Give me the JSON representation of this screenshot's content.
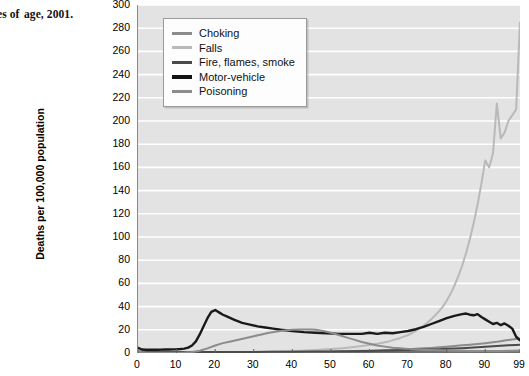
{
  "caption": {
    "line1": "g causes of",
    "line2": "age, 2001.",
    "source_label": "Source:",
    "line3": "L"
  },
  "chart_data": {
    "type": "line",
    "title": "",
    "xlabel": "",
    "ylabel": "Deaths per 100,000 population",
    "xlim": [
      0,
      99
    ],
    "ylim": [
      0,
      300
    ],
    "grid": true,
    "legend_position": "top-left-inside",
    "ytick_labels": [
      "300",
      "280",
      "260",
      "240",
      "220",
      "200",
      "180",
      "160",
      "140",
      "120",
      "100",
      "80",
      "60",
      "40",
      "20",
      "0"
    ],
    "ytick_values": [
      300,
      280,
      260,
      240,
      220,
      200,
      180,
      160,
      140,
      120,
      100,
      80,
      60,
      40,
      20,
      0
    ],
    "xtick_labels": [
      "0",
      "10",
      "20",
      "30",
      "40",
      "50",
      "60",
      "70",
      "80",
      "90",
      "99"
    ],
    "xtick_values": [
      0,
      10,
      20,
      30,
      40,
      50,
      60,
      70,
      80,
      90,
      99
    ],
    "colors": {
      "choking": "#8c8c8c",
      "falls": "#b9b9b9",
      "fire": "#4a4a4a",
      "motor_vehicle": "#1a1a1a",
      "poisoning": "#8c8c8c"
    },
    "series": [
      {
        "name": "Choking",
        "color": "#8c8c8c",
        "width": 2.0,
        "x": [
          0,
          1,
          2,
          3,
          4,
          5,
          6,
          7,
          8,
          9,
          10,
          12,
          14,
          16,
          18,
          20,
          22,
          25,
          28,
          30,
          33,
          36,
          39,
          42,
          45,
          48,
          50,
          53,
          56,
          59,
          62,
          65,
          68,
          70,
          72,
          74,
          76,
          78,
          80,
          82,
          84,
          86,
          88,
          90,
          91,
          92,
          93,
          94,
          95,
          96,
          97,
          98,
          99
        ],
        "values": [
          1.2,
          0.7,
          0.5,
          0.4,
          0.3,
          0.3,
          0.2,
          0.2,
          0.2,
          0.2,
          0.2,
          0.2,
          0.2,
          0.3,
          0.3,
          0.3,
          0.4,
          0.4,
          0.5,
          0.5,
          0.6,
          0.7,
          0.8,
          0.9,
          1.0,
          1.2,
          1.3,
          1.5,
          1.7,
          1.9,
          2.2,
          2.5,
          2.9,
          3.2,
          3.6,
          4.0,
          4.4,
          4.9,
          5.4,
          6.0,
          6.6,
          7.2,
          7.8,
          8.5,
          8.9,
          9.3,
          9.7,
          10.2,
          10.7,
          11.2,
          11.6,
          12.0,
          12.3
        ]
      },
      {
        "name": "Falls",
        "color": "#b9b9b9",
        "width": 2.0,
        "x": [
          0,
          2,
          4,
          6,
          8,
          10,
          12,
          14,
          16,
          18,
          20,
          22,
          25,
          28,
          30,
          33,
          36,
          39,
          42,
          45,
          48,
          50,
          53,
          56,
          59,
          62,
          65,
          68,
          70,
          72,
          74,
          76,
          78,
          79,
          80,
          81,
          82,
          83,
          84,
          85,
          86,
          87,
          88,
          89,
          90,
          91,
          92,
          93,
          94,
          95,
          96,
          97,
          98,
          99
        ],
        "values": [
          0.4,
          0.2,
          0.2,
          0.2,
          0.2,
          0.2,
          0.2,
          0.3,
          0.4,
          0.5,
          0.5,
          0.6,
          0.7,
          0.8,
          0.9,
          1.1,
          1.3,
          1.6,
          2.0,
          2.4,
          3.0,
          3.4,
          4.2,
          5.2,
          6.4,
          8.0,
          10.0,
          13.0,
          15.5,
          19.0,
          23.5,
          29.0,
          36.0,
          40.0,
          45.0,
          51.0,
          58.0,
          66.0,
          75.0,
          86.0,
          98.0,
          112.0,
          128.0,
          146.0,
          166.0,
          160.0,
          172.0,
          215.0,
          185.0,
          190.0,
          200.0,
          205.0,
          210.0,
          285.0
        ]
      },
      {
        "name": "Fire, flames, smoke",
        "color": "#4a4a4a",
        "width": 2.0,
        "x": [
          0,
          2,
          4,
          6,
          8,
          10,
          14,
          18,
          22,
          26,
          30,
          35,
          40,
          45,
          50,
          55,
          60,
          65,
          70,
          75,
          78,
          80,
          82,
          84,
          86,
          88,
          90,
          92,
          94,
          96,
          98,
          99
        ],
        "values": [
          1.0,
          1.6,
          1.4,
          1.2,
          1.0,
          0.9,
          0.8,
          0.8,
          0.8,
          0.9,
          0.9,
          1.0,
          1.1,
          1.2,
          1.3,
          1.5,
          1.8,
          2.1,
          2.5,
          3.0,
          3.3,
          3.6,
          3.9,
          4.2,
          4.6,
          5.0,
          5.4,
          5.8,
          6.2,
          6.6,
          7.0,
          7.2
        ]
      },
      {
        "name": "Motor-vehicle",
        "color": "#1a1a1a",
        "width": 2.4,
        "x": [
          0,
          1,
          2,
          3,
          4,
          5,
          6,
          7,
          8,
          9,
          10,
          11,
          12,
          13,
          14,
          15,
          16,
          17,
          18,
          19,
          20,
          21,
          22,
          23,
          24,
          25,
          27,
          29,
          31,
          33,
          35,
          37,
          40,
          43,
          46,
          49,
          52,
          55,
          58,
          60,
          62,
          64,
          66,
          68,
          70,
          72,
          74,
          76,
          78,
          80,
          82,
          84,
          85,
          86,
          87,
          88,
          89,
          90,
          91,
          92,
          93,
          94,
          95,
          96,
          97,
          98,
          99
        ],
        "values": [
          4.5,
          3.0,
          2.8,
          2.8,
          2.8,
          2.8,
          2.9,
          3.0,
          3.0,
          3.1,
          3.2,
          3.4,
          3.8,
          4.6,
          6.5,
          10.0,
          16.0,
          23.0,
          30.0,
          35.5,
          37.0,
          35.0,
          33.0,
          31.5,
          30.0,
          28.5,
          26.0,
          24.5,
          23.0,
          22.0,
          21.0,
          20.0,
          19.0,
          18.0,
          17.5,
          17.0,
          16.5,
          16.5,
          16.5,
          17.5,
          16.5,
          17.5,
          17.0,
          18.0,
          19.0,
          20.5,
          22.5,
          25.0,
          27.5,
          30.0,
          32.0,
          33.5,
          34.0,
          33.0,
          32.5,
          33.5,
          31.0,
          29.0,
          27.0,
          25.0,
          26.0,
          24.0,
          25.5,
          23.5,
          21.0,
          14.0,
          11.0
        ]
      },
      {
        "name": "Poisoning",
        "color": "#8c8c8c",
        "width": 2.0,
        "x": [
          0,
          2,
          4,
          6,
          8,
          10,
          12,
          14,
          16,
          18,
          20,
          22,
          24,
          26,
          28,
          30,
          32,
          34,
          36,
          38,
          40,
          42,
          44,
          45,
          46,
          48,
          50,
          52,
          54,
          56,
          58,
          60,
          62,
          64,
          66,
          68,
          70,
          74,
          78,
          82,
          86,
          90,
          94,
          97,
          99
        ],
        "values": [
          1.0,
          0.4,
          0.3,
          0.3,
          0.3,
          0.3,
          0.4,
          0.8,
          2.0,
          4.0,
          6.5,
          8.5,
          10.0,
          11.5,
          13.0,
          14.5,
          16.0,
          17.5,
          18.5,
          19.5,
          20.0,
          20.2,
          20.3,
          20.3,
          20.0,
          19.0,
          17.5,
          15.5,
          13.5,
          11.5,
          9.5,
          8.0,
          6.5,
          5.5,
          4.5,
          4.0,
          3.5,
          2.8,
          2.3,
          2.0,
          1.8,
          1.7,
          1.8,
          2.0,
          2.2
        ]
      }
    ],
    "legend_entries": [
      {
        "label": "Choking",
        "icon": "line-swatch",
        "color": "#8c8c8c",
        "thickness": 3
      },
      {
        "label": "Falls",
        "icon": "line-swatch",
        "color": "#b9b9b9",
        "thickness": 3
      },
      {
        "label": "Fire, flames, smoke",
        "icon": "line-swatch",
        "color": "#4a4a4a",
        "thickness": 3
      },
      {
        "label": "Motor-vehicle",
        "icon": "line-swatch",
        "color": "#121212",
        "thickness": 4
      },
      {
        "label": "Poisoning",
        "icon": "line-swatch",
        "color": "#8c8c8c",
        "thickness": 3
      }
    ]
  }
}
